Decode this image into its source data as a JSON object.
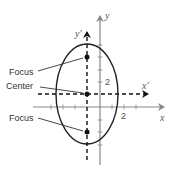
{
  "diagram": {
    "title": "",
    "labels": {
      "focus_upper": "Focus",
      "center": "Center",
      "focus_lower": "Focus",
      "y_axis": "y",
      "x_axis": "x",
      "y_prime_axis": "y'",
      "x_prime_axis": "x'",
      "y_tick": "2",
      "x_tick": "2"
    },
    "colors": {
      "axis": "#888888",
      "ellipse": "#222222",
      "dashed_axis": "#111111",
      "points": "#111111",
      "leader_lines": "#333333"
    },
    "geometry": {
      "center": [
        87,
        94
      ],
      "semi_axis_x": 31,
      "semi_axis_y": 50,
      "foci": [
        [
          87,
          57
        ],
        [
          87,
          132
        ]
      ]
    }
  }
}
